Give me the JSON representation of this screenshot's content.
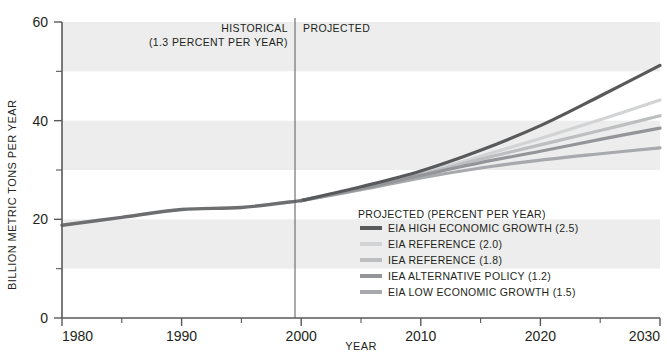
{
  "chart_data": {
    "type": "line",
    "title": "",
    "xlabel": "YEAR",
    "ylabel": "BILLION METRIC TONS PER YEAR",
    "xlim": [
      1980,
      2030
    ],
    "ylim": [
      0,
      60
    ],
    "xticks": [
      1980,
      1990,
      2000,
      2010,
      2020,
      2030
    ],
    "xtick_labels": [
      "1980",
      "1990",
      "2000",
      "2010",
      "2020",
      "2030"
    ],
    "yticks": [
      0,
      20,
      40,
      60
    ],
    "ytick_labels": [
      "0",
      "20",
      "40",
      "60"
    ],
    "yminorticks": [
      10,
      30,
      50
    ],
    "grid": false,
    "banding": "alternating light gray horizontal bands every 10 units starting at 10-20",
    "band_color": "#ededed",
    "divider_year": 2000,
    "annotations": [
      {
        "name": "historical",
        "line1": "HISTORICAL",
        "line2": "(1.3 PERCENT PER YEAR)"
      },
      {
        "name": "projected",
        "line1": "PROJECTED",
        "line2": ""
      }
    ],
    "legend_title": "PROJECTED (PERCENT PER YEAR)",
    "legend_position": "inside lower right",
    "historical": {
      "name": "HISTORICAL",
      "color": "#6d6e70",
      "x": [
        1980,
        1985,
        1990,
        1995,
        2000
      ],
      "values": [
        18.8,
        20.4,
        22.0,
        22.4,
        23.8
      ]
    },
    "series": [
      {
        "name": "EIA HIGH ECONOMIC GROWTH (2.5)",
        "rate": 2.5,
        "color": "#58595b",
        "x": [
          2000,
          2005,
          2010,
          2015,
          2020,
          2025,
          2030
        ],
        "values": [
          23.8,
          26.6,
          29.8,
          34.0,
          39.0,
          45.0,
          51.2
        ]
      },
      {
        "name": "EIA REFERENCE (2.0)",
        "rate": 2.0,
        "color": "#d1d3d4",
        "x": [
          2000,
          2005,
          2010,
          2015,
          2020,
          2025,
          2030
        ],
        "values": [
          23.8,
          26.4,
          29.3,
          32.8,
          36.4,
          40.2,
          44.2
        ]
      },
      {
        "name": "IEA REFERENCE (1.8)",
        "rate": 1.8,
        "color": "#bcbec0",
        "x": [
          2000,
          2005,
          2010,
          2015,
          2020,
          2025,
          2030
        ],
        "values": [
          23.8,
          26.3,
          29.1,
          32.2,
          35.1,
          38.0,
          41.0
        ]
      },
      {
        "name": "IEA ALTERNATIVE POLICY (1.2)",
        "rate": 1.2,
        "color": "#939598",
        "x": [
          2000,
          2005,
          2010,
          2015,
          2020,
          2025,
          2030
        ],
        "values": [
          23.8,
          26.2,
          28.9,
          31.5,
          33.8,
          36.2,
          38.5
        ]
      },
      {
        "name": "EIA LOW ECONOMIC GROWTH (1.5)",
        "rate": 1.5,
        "color": "#a7a9ac",
        "x": [
          2000,
          2005,
          2010,
          2015,
          2020,
          2025,
          2030
        ],
        "values": [
          23.8,
          26.0,
          28.4,
          30.4,
          32.0,
          33.3,
          34.5
        ]
      }
    ]
  },
  "legend": {
    "title": "PROJECTED (PERCENT PER YEAR)",
    "items": [
      {
        "label": "EIA HIGH ECONOMIC GROWTH (2.5)",
        "color": "#58595b"
      },
      {
        "label": "EIA REFERENCE (2.0)",
        "color": "#d1d3d4"
      },
      {
        "label": "IEA REFERENCE (1.8)",
        "color": "#bcbec0"
      },
      {
        "label": "IEA ALTERNATIVE POLICY (1.2)",
        "color": "#939598"
      },
      {
        "label": "EIA LOW ECONOMIC GROWTH (1.5)",
        "color": "#a7a9ac"
      }
    ]
  },
  "annotations": {
    "historical_line1": "HISTORICAL",
    "historical_line2": "(1.3 PERCENT PER YEAR)",
    "projected_line1": "PROJECTED"
  },
  "axes": {
    "x_title": "YEAR",
    "y_title": "BILLION METRIC TONS PER YEAR"
  },
  "colors": {
    "band": "#ededed",
    "axis": "#58595b",
    "text": "#231f20"
  }
}
